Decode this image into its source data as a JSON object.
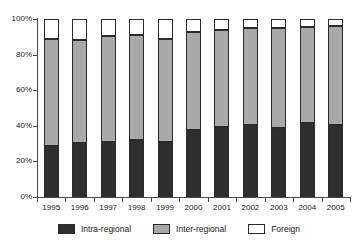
{
  "chart_data": {
    "type": "bar",
    "subtype": "stacked-percentage",
    "title": "",
    "xlabel": "",
    "ylabel": "",
    "categories": [
      "1995",
      "1996",
      "1997",
      "1998",
      "1999",
      "2000",
      "2001",
      "2002",
      "2003",
      "2004",
      "2005"
    ],
    "series": [
      {
        "name": "Intra-regional",
        "color": "#2e2e2e",
        "values": [
          28.5,
          30.5,
          31.0,
          32.0,
          31.0,
          37.5,
          39.5,
          40.5,
          39.0,
          41.5,
          40.5
        ]
      },
      {
        "name": "Inter-regional",
        "color": "#a9a9a9",
        "values": [
          60.0,
          57.5,
          59.5,
          59.0,
          58.0,
          55.0,
          54.5,
          54.5,
          56.0,
          54.0,
          55.5
        ]
      },
      {
        "name": "Foreign",
        "color": "#ffffff",
        "values": [
          11.5,
          12.0,
          9.5,
          9.0,
          11.0,
          7.5,
          6.0,
          5.0,
          5.0,
          4.5,
          4.0
        ]
      }
    ],
    "cumulative_tops": {
      "intra_regional": [
        28.5,
        30.5,
        31.0,
        32.0,
        31.0,
        37.5,
        39.5,
        40.5,
        39.0,
        41.5,
        40.5
      ],
      "inter_regional": [
        88.5,
        88.0,
        90.5,
        91.0,
        89.0,
        92.5,
        94.0,
        95.0,
        95.0,
        95.5,
        96.0
      ]
    },
    "ylim": [
      0,
      100
    ],
    "yticks": [
      0,
      20,
      40,
      60,
      80,
      100
    ],
    "ytick_labels": [
      "0%",
      "20%",
      "40%",
      "60%",
      "80%",
      "100%"
    ],
    "grid": false,
    "legend_position": "bottom"
  },
  "legend": {
    "items": [
      {
        "label": "Intra-regional",
        "color": "#2e2e2e"
      },
      {
        "label": "Inter-regional",
        "color": "#a9a9a9"
      },
      {
        "label": "Foreign",
        "color": "#ffffff"
      }
    ]
  }
}
